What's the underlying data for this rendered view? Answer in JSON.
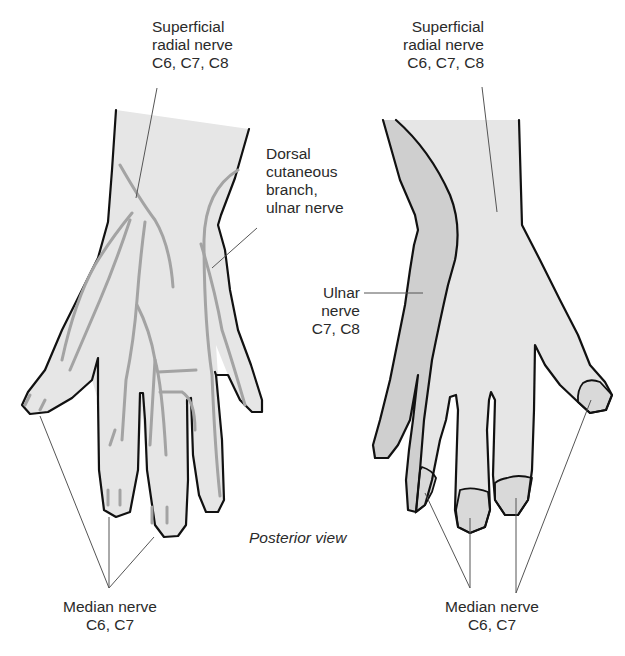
{
  "figure": {
    "view_caption": "Posterior view",
    "colors": {
      "skin": "#e6e6e6",
      "ulnar_zone": "#cfcfcf",
      "median_zone": "#d9d9d9",
      "nerve_line": "#a3a3a3",
      "outline": "#111111",
      "leader_line": "#555555",
      "text": "#2a2a2a"
    },
    "left_hand": {
      "labels": {
        "superficial_radial": {
          "lines": [
            "Superficial",
            "radial nerve",
            "C6, C7, C8"
          ]
        },
        "dorsal_cutaneous": {
          "lines": [
            "Dorsal",
            "cutaneous",
            "branch,",
            "ulnar nerve"
          ]
        },
        "median": {
          "lines": [
            "Median nerve",
            "C6, C7"
          ]
        }
      }
    },
    "right_hand": {
      "labels": {
        "superficial_radial": {
          "lines": [
            "Superficial",
            "radial nerve",
            "C6, C7, C8"
          ]
        },
        "ulnar": {
          "lines": [
            "Ulnar",
            "nerve",
            "C7, C8"
          ]
        },
        "median": {
          "lines": [
            "Median nerve",
            "C6, C7"
          ]
        }
      }
    }
  }
}
